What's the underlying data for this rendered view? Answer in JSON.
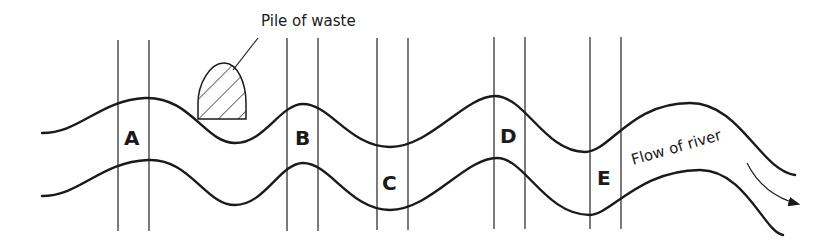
{
  "diagram": {
    "title_annotation": "Pile of waste",
    "flow_label": "Flow of river",
    "sample_sites": [
      {
        "label": "A"
      },
      {
        "label": "B"
      },
      {
        "label": "C"
      },
      {
        "label": "D"
      },
      {
        "label": "E"
      }
    ],
    "colors": {
      "stroke": "#1a1a1a",
      "background": "#ffffff"
    }
  }
}
